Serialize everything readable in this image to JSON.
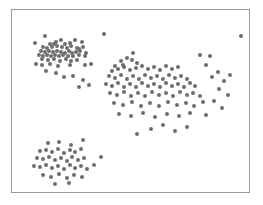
{
  "figure": {
    "background_color": "#ffffff",
    "frame": {
      "x": 11,
      "y": 9,
      "width": 239,
      "height": 184,
      "border_color": "#9a9a9a",
      "border_width": 1,
      "fill_color": "#ffffff"
    },
    "title": "",
    "subtitle": ""
  },
  "chart_data": {
    "type": "scatter",
    "title": "",
    "xlabel": "",
    "ylabel": "",
    "xlim": [
      0,
      239
    ],
    "ylim": [
      0,
      184
    ],
    "grid": false,
    "legend": null,
    "axis_ticks": false,
    "axis_tick_labels": false,
    "marker": {
      "shape": "circle",
      "size_px": 4,
      "color": "#6e6e6e",
      "opacity": 1
    },
    "point_count": 177,
    "cluster_summary": [
      {
        "name": "upper-left cluster",
        "approx_center": [
          48,
          36
        ],
        "count": 52
      },
      {
        "name": "central cluster",
        "approx_center": [
          135,
          75
        ],
        "count": 80
      },
      {
        "name": "lower-left cluster",
        "approx_center": [
          48,
          148
        ],
        "count": 45
      }
    ],
    "series": [
      {
        "name": "points",
        "color": "#6e6e6e",
        "points": [
          [
            93,
            24
          ],
          [
            68,
            39
          ],
          [
            122,
            43
          ],
          [
            112,
            56
          ],
          [
            190,
            45
          ],
          [
            231,
            26
          ],
          [
            23,
            33
          ],
          [
            33,
            26
          ],
          [
            44,
            32
          ],
          [
            49,
            30
          ],
          [
            38,
            34
          ],
          [
            42,
            34
          ],
          [
            53,
            34
          ],
          [
            58,
            33
          ],
          [
            64,
            30
          ],
          [
            71,
            32
          ],
          [
            31,
            37
          ],
          [
            35,
            38
          ],
          [
            40,
            37
          ],
          [
            45,
            36
          ],
          [
            50,
            37
          ],
          [
            55,
            38
          ],
          [
            60,
            36
          ],
          [
            66,
            38
          ],
          [
            72,
            37
          ],
          [
            29,
            41
          ],
          [
            33,
            42
          ],
          [
            37,
            41
          ],
          [
            41,
            42
          ],
          [
            45,
            41
          ],
          [
            49,
            42
          ],
          [
            53,
            43
          ],
          [
            57,
            41
          ],
          [
            61,
            43
          ],
          [
            65,
            42
          ],
          [
            69,
            41
          ],
          [
            75,
            43
          ],
          [
            27,
            45
          ],
          [
            31,
            46
          ],
          [
            35,
            45
          ],
          [
            39,
            46
          ],
          [
            43,
            45
          ],
          [
            47,
            46
          ],
          [
            51,
            45
          ],
          [
            56,
            47
          ],
          [
            62,
            46
          ],
          [
            68,
            45
          ],
          [
            74,
            47
          ],
          [
            30,
            50
          ],
          [
            36,
            51
          ],
          [
            42,
            50
          ],
          [
            48,
            52
          ],
          [
            54,
            50
          ],
          [
            60,
            52
          ],
          [
            66,
            51
          ],
          [
            24,
            55
          ],
          [
            30,
            56
          ],
          [
            38,
            55
          ],
          [
            46,
            57
          ],
          [
            58,
            56
          ],
          [
            74,
            56
          ],
          [
            80,
            55
          ],
          [
            34,
            62
          ],
          [
            44,
            64
          ],
          [
            52,
            68
          ],
          [
            62,
            67
          ],
          [
            72,
            71
          ],
          [
            68,
            78
          ],
          [
            78,
            76
          ],
          [
            104,
            57
          ],
          [
            110,
            52
          ],
          [
            116,
            49
          ],
          [
            121,
            51
          ],
          [
            126,
            54
          ],
          [
            101,
            62
          ],
          [
            107,
            60
          ],
          [
            113,
            58
          ],
          [
            119,
            61
          ],
          [
            125,
            59
          ],
          [
            131,
            57
          ],
          [
            137,
            60
          ],
          [
            143,
            58
          ],
          [
            149,
            61
          ],
          [
            155,
            57
          ],
          [
            161,
            60
          ],
          [
            167,
            58
          ],
          [
            98,
            67
          ],
          [
            104,
            69
          ],
          [
            110,
            66
          ],
          [
            116,
            70
          ],
          [
            122,
            67
          ],
          [
            128,
            70
          ],
          [
            134,
            66
          ],
          [
            140,
            69
          ],
          [
            146,
            67
          ],
          [
            152,
            70
          ],
          [
            158,
            66
          ],
          [
            164,
            69
          ],
          [
            170,
            67
          ],
          [
            176,
            70
          ],
          [
            95,
            75
          ],
          [
            101,
            77
          ],
          [
            107,
            74
          ],
          [
            113,
            78
          ],
          [
            119,
            75
          ],
          [
            125,
            78
          ],
          [
            131,
            74
          ],
          [
            137,
            77
          ],
          [
            143,
            75
          ],
          [
            149,
            78
          ],
          [
            155,
            74
          ],
          [
            161,
            77
          ],
          [
            167,
            75
          ],
          [
            173,
            78
          ],
          [
            179,
            74
          ],
          [
            185,
            77
          ],
          [
            99,
            84
          ],
          [
            106,
            86
          ],
          [
            113,
            83
          ],
          [
            120,
            87
          ],
          [
            127,
            84
          ],
          [
            134,
            87
          ],
          [
            141,
            83
          ],
          [
            148,
            86
          ],
          [
            155,
            84
          ],
          [
            162,
            87
          ],
          [
            169,
            83
          ],
          [
            176,
            86
          ],
          [
            183,
            84
          ],
          [
            190,
            87
          ],
          [
            103,
            94
          ],
          [
            112,
            96
          ],
          [
            121,
            93
          ],
          [
            130,
            97
          ],
          [
            139,
            94
          ],
          [
            148,
            97
          ],
          [
            157,
            93
          ],
          [
            166,
            96
          ],
          [
            175,
            94
          ],
          [
            184,
            97
          ],
          [
            193,
            93
          ],
          [
            108,
            105
          ],
          [
            120,
            107
          ],
          [
            132,
            104
          ],
          [
            144,
            108
          ],
          [
            156,
            105
          ],
          [
            168,
            107
          ],
          [
            180,
            104
          ],
          [
            196,
            106
          ],
          [
            202,
            68
          ],
          [
            208,
            63
          ],
          [
            214,
            72
          ],
          [
            220,
            66
          ],
          [
            209,
            80
          ],
          [
            218,
            86
          ],
          [
            204,
            92
          ],
          [
            212,
            99
          ],
          [
            140,
            120
          ],
          [
            152,
            116
          ],
          [
            164,
            122
          ],
          [
            176,
            118
          ],
          [
            126,
            125
          ],
          [
            196,
            56
          ],
          [
            200,
            46
          ],
          [
            36,
            134
          ],
          [
            47,
            133
          ],
          [
            60,
            136
          ],
          [
            72,
            131
          ],
          [
            28,
            143
          ],
          [
            34,
            142
          ],
          [
            40,
            144
          ],
          [
            46,
            141
          ],
          [
            52,
            145
          ],
          [
            58,
            142
          ],
          [
            64,
            144
          ],
          [
            70,
            141
          ],
          [
            25,
            150
          ],
          [
            31,
            151
          ],
          [
            37,
            149
          ],
          [
            43,
            152
          ],
          [
            49,
            150
          ],
          [
            55,
            153
          ],
          [
            61,
            149
          ],
          [
            67,
            152
          ],
          [
            73,
            150
          ],
          [
            22,
            158
          ],
          [
            28,
            159
          ],
          [
            34,
            157
          ],
          [
            40,
            160
          ],
          [
            46,
            158
          ],
          [
            52,
            161
          ],
          [
            58,
            157
          ],
          [
            64,
            160
          ],
          [
            70,
            158
          ],
          [
            76,
            161
          ],
          [
            31,
            167
          ],
          [
            39,
            169
          ],
          [
            47,
            166
          ],
          [
            55,
            170
          ],
          [
            63,
            167
          ],
          [
            71,
            169
          ],
          [
            43,
            176
          ],
          [
            57,
            175
          ],
          [
            83,
            157
          ],
          [
            90,
            149
          ]
        ]
      }
    ]
  }
}
